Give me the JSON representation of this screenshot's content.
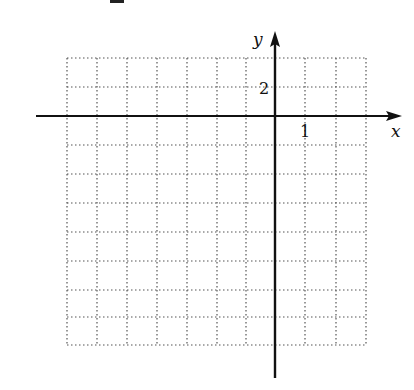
{
  "figure": {
    "type": "coordinate-grid",
    "x_axis_label": "x",
    "y_axis_label": "y",
    "x_tick_label": "1",
    "y_tick_label": "2",
    "x_unit_per_cell": 1,
    "y_unit_per_cell": 2,
    "grid": {
      "columns": 10,
      "rows": 10,
      "x_range_cells": [
        -7,
        3
      ],
      "y_range_cells": [
        -8,
        2
      ],
      "line_style": "dotted"
    },
    "colors": {
      "axis": "#111111",
      "grid": "#555555",
      "background": "#ffffff"
    }
  }
}
